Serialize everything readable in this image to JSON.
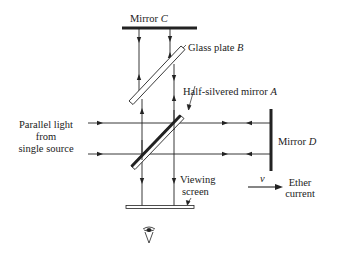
{
  "diagram": {
    "labels": {
      "mirror_c": "Mirror ",
      "mirror_c_letter": "C",
      "glass_plate": "Glass plate ",
      "glass_plate_letter": "B",
      "half_silvered": "Half-silvered mirror ",
      "half_silvered_letter": "A",
      "source_line1": "Parallel light",
      "source_line2": "from",
      "source_line3": "single source",
      "mirror_d": "Mirror ",
      "mirror_d_letter": "D",
      "viewing_line1": "Viewing",
      "viewing_line2": "screen",
      "velocity": "v",
      "ether_line1": "Ether",
      "ether_line2": "current"
    },
    "icons": {
      "eye": "eye-icon"
    },
    "colors": {
      "ink": "#222222",
      "background": "#ffffff"
    }
  }
}
